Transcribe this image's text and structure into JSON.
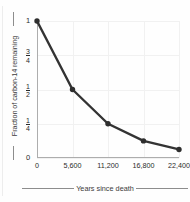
{
  "chart_data": {
    "type": "line",
    "title": "",
    "subtitle": "",
    "xlabel": "Years since death",
    "ylabel": "Fraction of carbon-14 remaining",
    "x": [
      0,
      5600,
      11200,
      16800,
      22400
    ],
    "values": [
      1,
      0.5,
      0.25,
      0.125,
      0.0625
    ],
    "point_labels": [
      "1",
      "1/2",
      "1/4",
      "1/8",
      "1/16"
    ],
    "series": [
      {
        "name": "Fraction of carbon-14 remaining",
        "values": [
          1,
          0.5,
          0.25,
          0.125,
          0.0625
        ]
      }
    ],
    "xlim": [
      0,
      22400
    ],
    "ylim": [
      0,
      1
    ],
    "xticks": [
      0,
      5600,
      11200,
      16800,
      22400
    ],
    "xtick_labels": [
      "0",
      "5,600",
      "11,200",
      "16,800",
      "22,400"
    ],
    "yticks": [
      0,
      0.25,
      0.5,
      0.75,
      1
    ],
    "ytick_labels": [
      "0",
      "1/4",
      "1/2",
      "3/4",
      "1"
    ],
    "ytick_label_parts": [
      {
        "whole": "0"
      },
      {
        "num": "1",
        "den": "4"
      },
      {
        "num": "1",
        "den": "2"
      },
      {
        "num": "3",
        "den": "4"
      },
      {
        "whole": "1"
      }
    ],
    "grid": true,
    "legend": false,
    "legend_position": "none",
    "annotations": [],
    "colors": {
      "line": "#333333",
      "marker": "#2e2e2e",
      "grid": "#f1f1f1",
      "axis": "#adadad",
      "text": "#2b2b2b",
      "label_rule": "#8d8d8d",
      "background": "#fefefe"
    }
  }
}
